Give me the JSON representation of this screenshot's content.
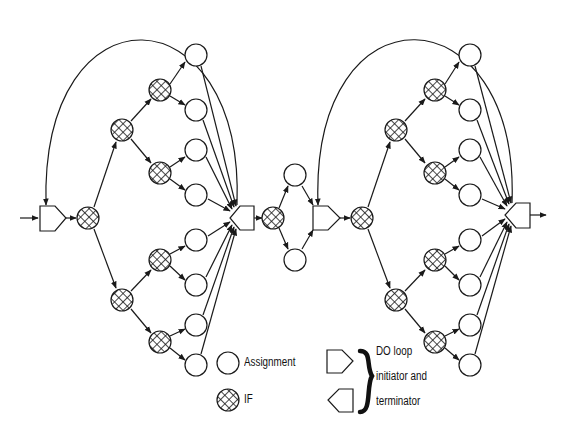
{
  "diagram": {
    "type": "control-flow graph",
    "colors": {
      "stroke": "#1a1a1a",
      "background": "#ffffff",
      "hatch": "#1a1a1a"
    },
    "node_types": {
      "assignment": "circle",
      "if": "cross-hatched circle",
      "do_initiator": "pentagon pointing right",
      "do_terminator": "pentagon pointing left"
    },
    "loops": [
      {
        "name": "first DO loop",
        "initiator": [
          50,
          218
        ],
        "terminator": [
          243,
          218
        ]
      },
      {
        "name": "second DO loop",
        "initiator": [
          323,
          218
        ],
        "terminator": [
          518,
          215
        ]
      }
    ],
    "middle_branch": {
      "if": [
        273,
        218
      ],
      "assignments": [
        [
          295,
          175
        ],
        [
          295,
          260
        ]
      ]
    }
  },
  "legend": {
    "assignment_label": "Assignment",
    "if_label": "IF",
    "do_loop_line1": "DO loop",
    "do_loop_line2": "initiator and",
    "do_loop_line3": "terminator"
  }
}
